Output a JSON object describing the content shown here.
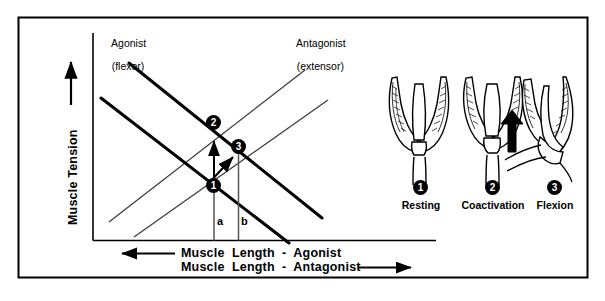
{
  "figure": {
    "type": "diagram"
  },
  "graph": {
    "y_axis_label": "Muscle Tension",
    "y_axis_arrow": "up-arrow",
    "x_axis_label_top": "Muscle  Length  -  Agonist",
    "x_axis_label_bottom": "Muscle  Length  -  Antagonist",
    "x_axis_arrow_left": "left-arrow",
    "x_axis_arrow_right": "right-arrow",
    "curve_labels": {
      "agonist_line1": "Agonist",
      "agonist_line2": "(flexor)",
      "antagonist_line1": "Antagonist",
      "antagonist_line2": "(extensor)"
    },
    "drop_line_labels": {
      "a": "a",
      "b": "b"
    },
    "markers": [
      {
        "id": "1",
        "label": "1"
      },
      {
        "id": "2",
        "label": "2"
      },
      {
        "id": "3",
        "label": "3"
      }
    ],
    "annotation_arrows": [
      {
        "name": "tension-increase-arrow",
        "from": "1",
        "to": "2"
      },
      {
        "name": "shortening-arrow",
        "from": "1",
        "to": "3"
      }
    ]
  },
  "stages": [
    {
      "marker": "1",
      "caption": "Resting"
    },
    {
      "marker": "2",
      "caption": "Coactivation"
    },
    {
      "marker": "3",
      "caption": "Flexion"
    }
  ],
  "illustration": {
    "name": "limb-joint-drawings",
    "flexion_arrow": "up-arrow"
  },
  "colors": {
    "ink": "#000000",
    "paper": "#ffffff",
    "thin_line": "#3a3a3a",
    "dropline": "#555555"
  }
}
